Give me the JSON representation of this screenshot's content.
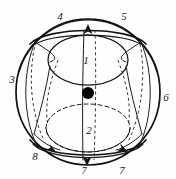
{
  "figure": {
    "name": "sphere-topology-diagram",
    "type": "line-diagram",
    "background_color": "#fefefe",
    "ink_color": "#141414",
    "dot_color": "#000000",
    "labels": {
      "region_upper": "1",
      "region_lower": "2",
      "left": "3",
      "top_left": "4",
      "top_right": "5",
      "right": "6",
      "bottom_right": "7",
      "bottom_center": "7",
      "bottom_left": "8"
    },
    "elements": {
      "outer_sphere": "sphere-outline",
      "upper_ellipse": "upper-region-ellipse",
      "lower_ellipse": "lower-region-ellipse",
      "center_point": "center-dot",
      "polar_axis": "vertical-axis-line",
      "meridians": "meridian-curves",
      "hidden_edges": "dashed-hidden-curves",
      "arrowheads": "direction-arrowheads"
    }
  }
}
